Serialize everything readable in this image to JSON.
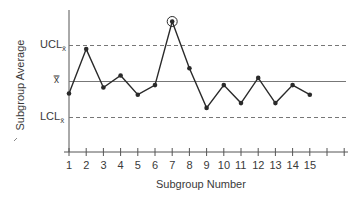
{
  "chart_data": {
    "type": "line",
    "title": "",
    "xlabel": "Subgroup Number",
    "ylabel": "Subgroup Average",
    "x": [
      1,
      2,
      3,
      4,
      5,
      6,
      7,
      8,
      9,
      10,
      11,
      12,
      13,
      14,
      15
    ],
    "x_tick_labels": [
      "1",
      "2",
      "3",
      "4",
      "5",
      "6",
      "7",
      "8",
      "9",
      "10",
      "11",
      "12",
      "13",
      "14",
      "15"
    ],
    "series": [
      {
        "name": "Subgroup Average",
        "values": [
          -1.0,
          2.7,
          -0.5,
          0.5,
          -1.1,
          -0.3,
          5.0,
          1.1,
          -2.2,
          -0.3,
          -1.8,
          0.3,
          -1.8,
          -0.3,
          -1.1
        ],
        "marker": "filled-circle",
        "highlighted_points": [
          7
        ]
      }
    ],
    "reference_lines": [
      {
        "name": "UCL_xbar",
        "label": "UCL",
        "subscript": "x̄",
        "value": 3,
        "style": "dashed"
      },
      {
        "name": "center_line",
        "label": "x̿",
        "value": 0,
        "style": "solid"
      },
      {
        "name": "LCL_xbar",
        "label": "LCL",
        "subscript": "x̄",
        "value": -3,
        "style": "dashed"
      }
    ],
    "annotations": [
      {
        "type": "circle",
        "x": 7,
        "note": "out-of-control point above UCL"
      }
    ],
    "ylim": [
      -5.5,
      6
    ],
    "xlim": [
      1,
      17
    ],
    "grid": false,
    "legend": "none"
  },
  "labels": {
    "ucl": "UCL",
    "ucl_sub": "x̄",
    "cl": "x̿",
    "lcl": "LCL",
    "lcl_sub": "x̄",
    "xlabel": "Subgroup Number",
    "ylabel": "Subgroup Average"
  },
  "colors": {
    "line": "#2a2a2a",
    "axis": "#555555",
    "limit": "#777777",
    "text": "#3a3a3a"
  }
}
